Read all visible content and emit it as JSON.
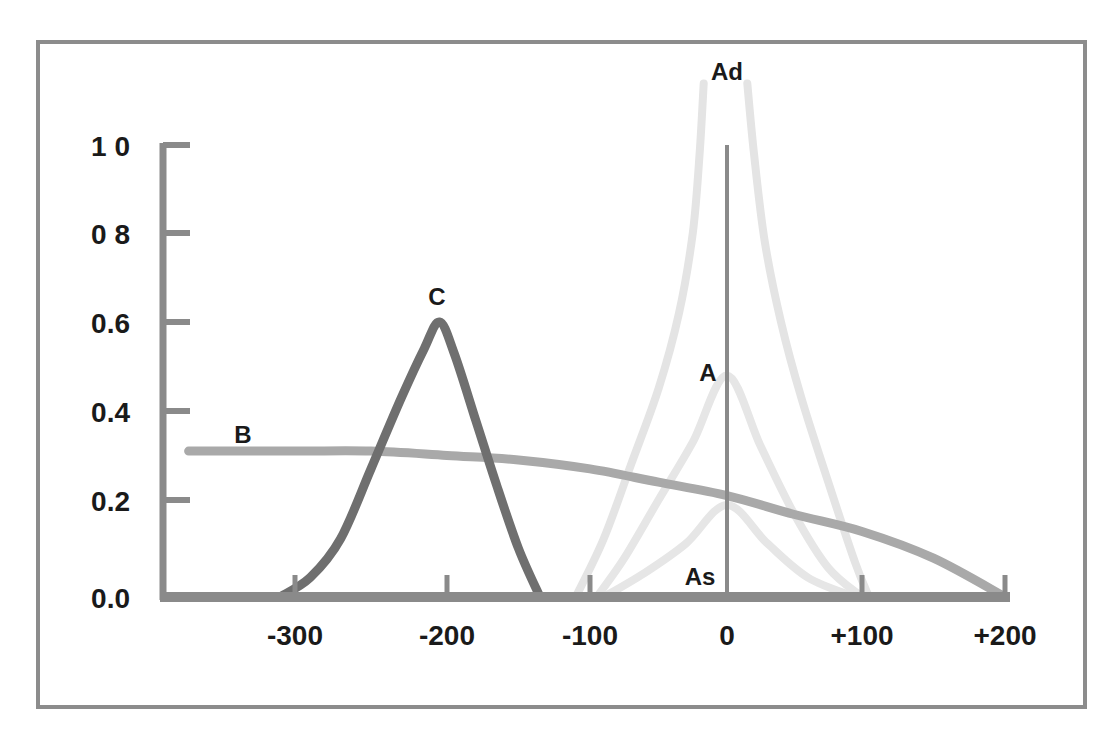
{
  "chart_data": {
    "type": "line",
    "title": "",
    "xlabel": "",
    "ylabel": "",
    "xlim": [
      -370,
      210
    ],
    "ylim": [
      0.0,
      1.0
    ],
    "grid": false,
    "legend": "inline labels",
    "x_ticks": [
      {
        "value": -300,
        "label": "-300",
        "px": 295
      },
      {
        "value": -200,
        "label": "-200",
        "px": 447
      },
      {
        "value": -100,
        "label": "-100",
        "px": 590
      },
      {
        "value": 0,
        "label": "0",
        "px": 727
      },
      {
        "value": 100,
        "label": "+100",
        "px": 862
      },
      {
        "value": 200,
        "label": "+200",
        "px": 1005
      }
    ],
    "y_ticks": [
      {
        "value": 0.0,
        "label": "0.0",
        "px": 597
      },
      {
        "value": 0.2,
        "label": "0.2",
        "px": 500
      },
      {
        "value": 0.4,
        "label": "0.4",
        "px": 411
      },
      {
        "value": 0.6,
        "label": "0.6",
        "px": 322
      },
      {
        "value": 0.8,
        "label": "0 8",
        "px": 233
      },
      {
        "value": 1.0,
        "label": "1 0",
        "px": 145
      }
    ],
    "series": [
      {
        "name": "B",
        "color": "#a9a9a9",
        "width": 9,
        "label_pos": [
          -340,
          0.36
        ],
        "x": [
          -370,
          -300,
          -250,
          -200,
          -150,
          -100,
          -50,
          0,
          50,
          100,
          150,
          200
        ],
        "y": [
          0.31,
          0.31,
          0.31,
          0.3,
          0.29,
          0.27,
          0.24,
          0.21,
          0.17,
          0.135,
          0.08,
          0.0
        ]
      },
      {
        "name": "C",
        "color": "#6f6f6f",
        "width": 9,
        "label_pos": [
          -210,
          0.65
        ],
        "x": [
          -310,
          -290,
          -270,
          -250,
          -230,
          -215,
          -205,
          -195,
          -180,
          -165,
          -150,
          -135
        ],
        "y": [
          0.0,
          0.04,
          0.12,
          0.27,
          0.43,
          0.54,
          0.6,
          0.53,
          0.38,
          0.23,
          0.1,
          0.0
        ]
      },
      {
        "name": "Ad",
        "color": "#e4e4e4",
        "width": 8,
        "label_pos": [
          0,
          1.25
        ],
        "x": [
          -110,
          -90,
          -70,
          -50,
          -35,
          -25,
          -20,
          -17
        ],
        "y": [
          0.0,
          0.12,
          0.28,
          0.45,
          0.62,
          0.8,
          0.98,
          1.14
        ],
        "x2": [
          15,
          20,
          28,
          40,
          55,
          75,
          95,
          105
        ],
        "y2": [
          1.14,
          0.98,
          0.78,
          0.6,
          0.43,
          0.24,
          0.07,
          0.0
        ]
      },
      {
        "name": "A",
        "color": "#e6e6e6",
        "width": 8,
        "label_pos": [
          -15,
          0.5
        ],
        "x": [
          -95,
          -75,
          -50,
          -25,
          0,
          25,
          50,
          75,
          100
        ],
        "y": [
          0.0,
          0.08,
          0.2,
          0.33,
          0.48,
          0.32,
          0.17,
          0.06,
          0.0
        ]
      },
      {
        "name": "As",
        "color": "#e6e6e6",
        "width": 8,
        "label_pos": [
          -15,
          0.02
        ],
        "x": [
          -90,
          -60,
          -30,
          0,
          30,
          60,
          95
        ],
        "y": [
          0.0,
          0.05,
          0.11,
          0.19,
          0.11,
          0.04,
          0.0
        ]
      }
    ],
    "annotations": [
      {
        "text": "Ad"
      },
      {
        "text": "A"
      },
      {
        "text": "As"
      },
      {
        "text": "B"
      },
      {
        "text": "C"
      }
    ]
  },
  "labels": {
    "B": "B",
    "C": "C",
    "A": "A",
    "As": "As",
    "Ad": "Ad"
  }
}
